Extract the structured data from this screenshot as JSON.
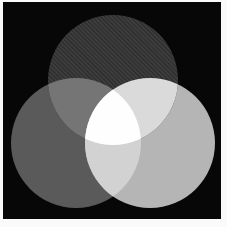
{
  "figure": {
    "page_background": "#fafafa",
    "frame": {
      "fill": "#070707",
      "x": 3,
      "y": 2,
      "width": 218,
      "height": 217
    },
    "venn": {
      "radius": 65,
      "edge_softness": 0.6,
      "circles": [
        {
          "name": "top-circle",
          "cx": 113,
          "cy": 80,
          "fill": "#3a3a3a",
          "textured": true
        },
        {
          "name": "left-circle",
          "cx": 76,
          "cy": 143,
          "fill": "#5a5a5a",
          "textured": false
        },
        {
          "name": "right-circle",
          "cx": 150,
          "cy": 143,
          "fill": "#b5b5b5",
          "textured": false
        }
      ],
      "overlap_fills": {
        "top_left": "#757575",
        "top_right": "#dadada",
        "left_right": "#d2d2d2",
        "center": "#fefefe"
      },
      "texture": {
        "dark": "#2b2b2b",
        "light": "#424242",
        "tile": 3,
        "angle": 45
      }
    }
  }
}
